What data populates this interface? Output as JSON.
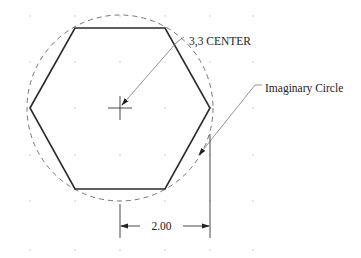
{
  "diagram": {
    "type": "cad-drawing",
    "labels": {
      "center_callout": "3,3 CENTER",
      "circle_callout": "Imaginary Circle",
      "dimension": "2.00"
    },
    "colors": {
      "background": "#ffffff",
      "hexagon_stroke": "#2a2a2a",
      "circle_stroke": "#777777",
      "leader_stroke": "#888888",
      "grid_dot": "#bbbbbb",
      "text": "#222222"
    },
    "grid": {
      "xs": [
        30,
        75,
        120,
        165,
        210,
        253
      ],
      "ys": [
        16,
        62,
        108,
        155,
        201,
        250
      ]
    },
    "center": {
      "x": 120,
      "y": 108
    },
    "circle_radius_px": 93,
    "hexagon_vertices": [
      [
        30,
        108
      ],
      [
        75,
        28
      ],
      [
        165,
        28
      ],
      [
        210,
        108
      ],
      [
        165,
        189
      ],
      [
        75,
        189
      ]
    ]
  }
}
